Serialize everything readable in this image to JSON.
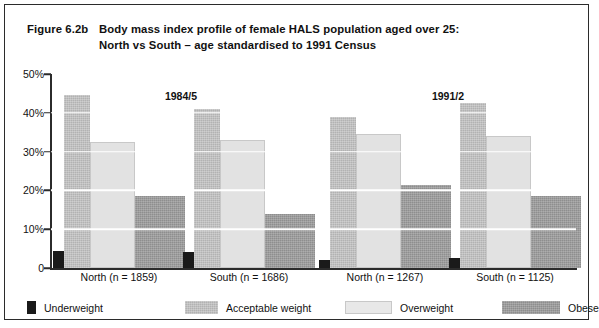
{
  "figure": {
    "number": "Figure 6.2b",
    "title_line1": "Body mass index profile of female HALS population aged over 25:",
    "title_line2": "North vs South – age standardised to 1991 Census"
  },
  "chart_data": {
    "type": "bar",
    "title": "Body mass index profile of female HALS population aged over 25: North vs South – age standardised to 1991 Census",
    "xlabel": "",
    "ylabel": "",
    "ylim": [
      0,
      50
    ],
    "ytick_labels": [
      "0",
      "10%",
      "20%",
      "30%",
      "40%",
      "50%"
    ],
    "ytick_values": [
      0,
      10,
      20,
      30,
      40,
      50
    ],
    "grid": true,
    "grid_color": "#ffffff",
    "legend_position": "bottom",
    "panel_labels": [
      "1984/5",
      "1991/2"
    ],
    "categories": [
      "North (n = 1859)",
      "South (n = 1686)",
      "North (n = 1267)",
      "South (n = 1125)"
    ],
    "series": [
      {
        "name": "Underweight",
        "color": "#1a1a1a",
        "values": [
          4.5,
          4.0,
          2.0,
          2.5
        ]
      },
      {
        "name": "Acceptable weight",
        "color": "#b2b2b2",
        "values": [
          44.5,
          41.0,
          39.0,
          42.5
        ]
      },
      {
        "name": "Overweight",
        "color": "#e2e2e2",
        "values": [
          32.5,
          33.0,
          34.5,
          34.0
        ]
      },
      {
        "name": "Obese",
        "color": "#8e8e8e",
        "values": [
          18.5,
          14.0,
          21.5,
          18.5
        ]
      }
    ],
    "groups": [
      {
        "period": "1984/5",
        "label": "North (n = 1859)",
        "region": "North",
        "n": 1859,
        "values": {
          "underweight": 4.5,
          "acceptable": 44.5,
          "overweight": 32.5,
          "obese": 18.5
        }
      },
      {
        "period": "1984/5",
        "label": "South (n = 1686)",
        "region": "South",
        "n": 1686,
        "values": {
          "underweight": 4.0,
          "acceptable": 41.0,
          "overweight": 33.0,
          "obese": 14.0
        }
      },
      {
        "period": "1991/2",
        "label": "North (n = 1267)",
        "region": "North",
        "n": 1267,
        "values": {
          "underweight": 2.0,
          "acceptable": 39.0,
          "overweight": 34.5,
          "obese": 21.5
        }
      },
      {
        "period": "1991/2",
        "label": "South (n = 1125)",
        "region": "South",
        "n": 1125,
        "values": {
          "underweight": 2.5,
          "acceptable": 42.5,
          "overweight": 34.0,
          "obese": 18.5
        }
      }
    ]
  },
  "legend": {
    "items": [
      {
        "label": "Underweight",
        "swatch": "underweight",
        "color": "#1a1a1a"
      },
      {
        "label": "Acceptable weight",
        "swatch": "acceptable",
        "color": "#b2b2b2"
      },
      {
        "label": "Overweight",
        "swatch": "overweight",
        "color": "#e2e2e2"
      },
      {
        "label": "Obese",
        "swatch": "obese",
        "color": "#8e8e8e"
      }
    ]
  }
}
